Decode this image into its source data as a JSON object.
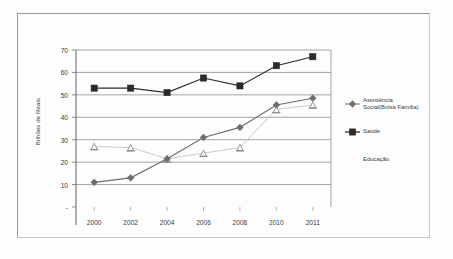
{
  "figure": {
    "background_color": "#fdfdfd",
    "frame_color": "#9a9a9a"
  },
  "chart_data": {
    "type": "line",
    "title": "",
    "xlabel": "",
    "ylabel": "Bilhões de Reais",
    "categories": [
      "2000",
      "2002",
      "2004",
      "2006",
      "2008",
      "2010",
      "2011"
    ],
    "ylim": [
      0,
      70
    ],
    "yticks": [
      "-",
      "10",
      "20",
      "30",
      "40",
      "50",
      "60",
      "70"
    ],
    "ytick_values": [
      0,
      10,
      20,
      30,
      40,
      50,
      60,
      70
    ],
    "grid": true,
    "grid_axis": "y",
    "legend_position": "right",
    "series": [
      {
        "name": "Assistência\nSocial(Bolsa Família)",
        "legend_label": "Assistência Social(Bolsa Família)",
        "marker": "diamond",
        "color": "#6e6e6e",
        "line_color": "#6e6e6e",
        "values": [
          11,
          13,
          21.5,
          31,
          35.5,
          45.5,
          48.5
        ]
      },
      {
        "name": "Saúde",
        "legend_label": "Saúde",
        "marker": "square",
        "color": "#2b2b2b",
        "line_color": "#2b2b2b",
        "values": [
          53,
          53,
          51,
          57.5,
          54,
          63,
          67
        ]
      },
      {
        "name": "Educação",
        "legend_label": "Educação",
        "marker": "triangle",
        "color": "#8d8d8d",
        "line_color": "#c4c4c4",
        "values": [
          27,
          26.5,
          21.5,
          24,
          26.5,
          43.5,
          45.5
        ]
      }
    ]
  }
}
